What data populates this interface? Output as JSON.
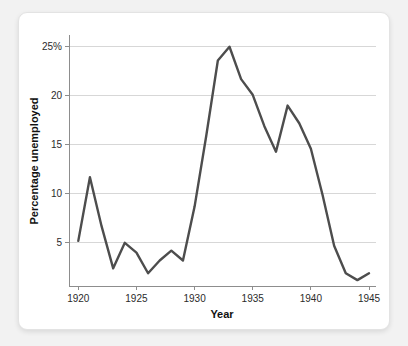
{
  "chart_data": {
    "type": "line",
    "title": "",
    "xlabel": "Year",
    "ylabel": "Percentage unemployed",
    "xlim": [
      1919.2,
      1945.6
    ],
    "ylim": [
      0.6,
      26.2
    ],
    "grid": true,
    "legend": "none",
    "line_color": "#4d4d4d",
    "grid_color": "#d7d7d7",
    "axis_color": "#8d8d8d",
    "background_color": "#ffffff",
    "x_ticks": [
      1920,
      1925,
      1930,
      1935,
      1940,
      1945
    ],
    "x_tick_labels": [
      "1920",
      "1925",
      "1930",
      "1935",
      "1940",
      "1945"
    ],
    "y_ticks": [
      5,
      10,
      15,
      20,
      25
    ],
    "y_tick_labels": [
      "5",
      "10",
      "15",
      "20",
      "25%"
    ],
    "x": [
      1920,
      1921,
      1922,
      1923,
      1924,
      1925,
      1926,
      1927,
      1928,
      1929,
      1930,
      1931,
      1932,
      1933,
      1934,
      1935,
      1936,
      1937,
      1938,
      1939,
      1940,
      1941,
      1942,
      1943,
      1944,
      1945
    ],
    "values": [
      5.2,
      11.7,
      6.7,
      2.4,
      5.0,
      4.0,
      1.9,
      3.2,
      4.2,
      3.2,
      8.7,
      15.9,
      23.6,
      25.0,
      21.7,
      20.1,
      16.9,
      14.3,
      19.0,
      17.2,
      14.6,
      9.9,
      4.7,
      1.9,
      1.2,
      1.9
    ],
    "series_name": "Percentage unemployed",
    "annotations": []
  }
}
